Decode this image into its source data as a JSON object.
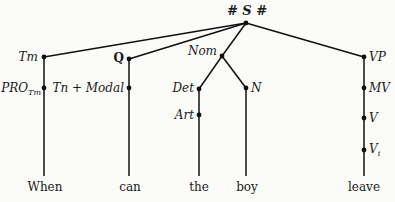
{
  "diagram": {
    "type": "syntax-tree",
    "root": {
      "label": "# S #"
    },
    "nodes": {
      "tm": "Tm",
      "q": "Q",
      "nom": "Nom",
      "vp": "VP",
      "pro": "PRO",
      "pro_sub": "Tm",
      "tn_modal": "Tn + Modal",
      "det": "Det",
      "n": "N",
      "art": "Art",
      "mv": "MV",
      "v": "V",
      "vi": "V",
      "vi_sub": "i"
    },
    "words": [
      "When",
      "can",
      "the",
      "boy",
      "leave"
    ],
    "edges": [
      [
        "S",
        "Tm"
      ],
      [
        "S",
        "Q"
      ],
      [
        "S",
        "Nom"
      ],
      [
        "S",
        "VP"
      ],
      [
        "Tm",
        "PRO_Tm"
      ],
      [
        "PRO_Tm",
        "When"
      ],
      [
        "Q",
        "Tn + Modal"
      ],
      [
        "Tn + Modal",
        "can"
      ],
      [
        "Nom",
        "Det"
      ],
      [
        "Nom",
        "N"
      ],
      [
        "Det",
        "Art"
      ],
      [
        "Art",
        "the"
      ],
      [
        "N",
        "boy"
      ],
      [
        "VP",
        "MV"
      ],
      [
        "MV",
        "V"
      ],
      [
        "V",
        "V_i"
      ],
      [
        "V_i",
        "leave"
      ]
    ]
  }
}
